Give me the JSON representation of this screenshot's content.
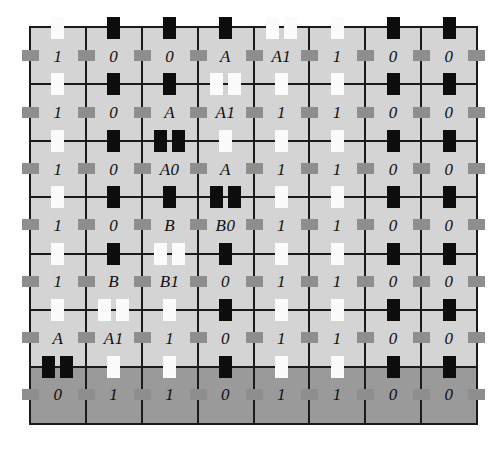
{
  "figure": {
    "kind": "encoded-grid-diagram",
    "columns": 8,
    "rows": 7,
    "colors": {
      "page_background": "#ffffff",
      "cell_light": "#d4d4d4",
      "cell_dark": "#9a9a9a",
      "rule": "#1a1a1a",
      "mark_black": "#0d0d0d",
      "mark_white": "#fbfbfb",
      "tick_gray": "#8e8e8e"
    }
  },
  "grid": {
    "rows": [
      {
        "index": 0,
        "shade": "light",
        "cells": [
          {
            "label": "1",
            "top_marks": [
              {
                "color": "white",
                "offset": 0
              }
            ],
            "bottom_marks": [
              {
                "color": "white",
                "offset": 0
              }
            ]
          },
          {
            "label": "0",
            "top_marks": [
              {
                "color": "black",
                "offset": 0
              }
            ],
            "bottom_marks": [
              {
                "color": "black",
                "offset": 0
              }
            ]
          },
          {
            "label": "0",
            "top_marks": [
              {
                "color": "black",
                "offset": 0
              }
            ],
            "bottom_marks": [
              {
                "color": "black",
                "offset": 0
              }
            ]
          },
          {
            "label": "A",
            "top_marks": [
              {
                "color": "black",
                "offset": 0
              }
            ],
            "bottom_marks": [
              {
                "color": "white",
                "offset": -9
              },
              {
                "color": "white",
                "offset": 9
              }
            ]
          },
          {
            "label": "A1",
            "top_marks": [
              {
                "color": "white",
                "offset": -9
              },
              {
                "color": "white",
                "offset": 9
              }
            ],
            "bottom_marks": [
              {
                "color": "white",
                "offset": 0
              }
            ]
          },
          {
            "label": "1",
            "top_marks": [
              {
                "color": "white",
                "offset": 0
              }
            ],
            "bottom_marks": [
              {
                "color": "white",
                "offset": 0
              }
            ]
          },
          {
            "label": "0",
            "top_marks": [
              {
                "color": "black",
                "offset": 0
              }
            ],
            "bottom_marks": [
              {
                "color": "black",
                "offset": 0
              }
            ]
          },
          {
            "label": "0",
            "top_marks": [
              {
                "color": "black",
                "offset": 0
              }
            ],
            "bottom_marks": [
              {
                "color": "black",
                "offset": 0
              }
            ]
          }
        ]
      },
      {
        "index": 1,
        "shade": "light",
        "cells": [
          {
            "label": "1",
            "bottom_marks": [
              {
                "color": "white",
                "offset": 0
              }
            ]
          },
          {
            "label": "0",
            "bottom_marks": [
              {
                "color": "black",
                "offset": 0
              }
            ]
          },
          {
            "label": "A",
            "bottom_marks": [
              {
                "color": "black",
                "offset": -9
              },
              {
                "color": "black",
                "offset": 9
              }
            ]
          },
          {
            "label": "A1",
            "bottom_marks": [
              {
                "color": "white",
                "offset": 0
              }
            ]
          },
          {
            "label": "1",
            "bottom_marks": [
              {
                "color": "white",
                "offset": 0
              }
            ]
          },
          {
            "label": "1",
            "bottom_marks": [
              {
                "color": "white",
                "offset": 0
              }
            ]
          },
          {
            "label": "0",
            "bottom_marks": [
              {
                "color": "black",
                "offset": 0
              }
            ]
          },
          {
            "label": "0",
            "bottom_marks": [
              {
                "color": "black",
                "offset": 0
              }
            ]
          }
        ]
      },
      {
        "index": 2,
        "shade": "light",
        "cells": [
          {
            "label": "1",
            "bottom_marks": [
              {
                "color": "white",
                "offset": 0
              }
            ]
          },
          {
            "label": "0",
            "bottom_marks": [
              {
                "color": "black",
                "offset": 0
              }
            ]
          },
          {
            "label": "A0",
            "bottom_marks": [
              {
                "color": "black",
                "offset": 0
              }
            ]
          },
          {
            "label": "A",
            "bottom_marks": [
              {
                "color": "black",
                "offset": -9
              },
              {
                "color": "black",
                "offset": 9
              }
            ]
          },
          {
            "label": "1",
            "bottom_marks": [
              {
                "color": "white",
                "offset": 0
              }
            ]
          },
          {
            "label": "1",
            "bottom_marks": [
              {
                "color": "white",
                "offset": 0
              }
            ]
          },
          {
            "label": "0",
            "bottom_marks": [
              {
                "color": "black",
                "offset": 0
              }
            ]
          },
          {
            "label": "0",
            "bottom_marks": [
              {
                "color": "black",
                "offset": 0
              }
            ]
          }
        ]
      },
      {
        "index": 3,
        "shade": "light",
        "cells": [
          {
            "label": "1",
            "bottom_marks": [
              {
                "color": "white",
                "offset": 0
              }
            ]
          },
          {
            "label": "0",
            "bottom_marks": [
              {
                "color": "black",
                "offset": 0
              }
            ]
          },
          {
            "label": "B",
            "bottom_marks": [
              {
                "color": "white",
                "offset": -9
              },
              {
                "color": "white",
                "offset": 9
              }
            ]
          },
          {
            "label": "B0",
            "bottom_marks": [
              {
                "color": "black",
                "offset": 0
              }
            ]
          },
          {
            "label": "1",
            "bottom_marks": [
              {
                "color": "white",
                "offset": 0
              }
            ]
          },
          {
            "label": "1",
            "bottom_marks": [
              {
                "color": "white",
                "offset": 0
              }
            ]
          },
          {
            "label": "0",
            "bottom_marks": [
              {
                "color": "black",
                "offset": 0
              }
            ]
          },
          {
            "label": "0",
            "bottom_marks": [
              {
                "color": "black",
                "offset": 0
              }
            ]
          }
        ]
      },
      {
        "index": 4,
        "shade": "light",
        "cells": [
          {
            "label": "1",
            "bottom_marks": [
              {
                "color": "white",
                "offset": 0
              }
            ]
          },
          {
            "label": "B",
            "bottom_marks": [
              {
                "color": "white",
                "offset": -9
              },
              {
                "color": "white",
                "offset": 9
              }
            ]
          },
          {
            "label": "B1",
            "bottom_marks": [
              {
                "color": "white",
                "offset": 0
              }
            ]
          },
          {
            "label": "0",
            "bottom_marks": [
              {
                "color": "black",
                "offset": 0
              }
            ]
          },
          {
            "label": "1",
            "bottom_marks": [
              {
                "color": "white",
                "offset": 0
              }
            ]
          },
          {
            "label": "1",
            "bottom_marks": [
              {
                "color": "white",
                "offset": 0
              }
            ]
          },
          {
            "label": "0",
            "bottom_marks": [
              {
                "color": "black",
                "offset": 0
              }
            ]
          },
          {
            "label": "0",
            "bottom_marks": [
              {
                "color": "black",
                "offset": 0
              }
            ]
          }
        ]
      },
      {
        "index": 5,
        "shade": "light",
        "cells": [
          {
            "label": "A",
            "bottom_marks": [
              {
                "color": "black",
                "offset": -9
              },
              {
                "color": "black",
                "offset": 9
              }
            ]
          },
          {
            "label": "A1",
            "bottom_marks": [
              {
                "color": "white",
                "offset": 0
              }
            ]
          },
          {
            "label": "1",
            "bottom_marks": [
              {
                "color": "white",
                "offset": 0
              }
            ]
          },
          {
            "label": "0",
            "bottom_marks": [
              {
                "color": "black",
                "offset": 0
              }
            ]
          },
          {
            "label": "1",
            "bottom_marks": [
              {
                "color": "white",
                "offset": 0
              }
            ]
          },
          {
            "label": "1",
            "bottom_marks": [
              {
                "color": "white",
                "offset": 0
              }
            ]
          },
          {
            "label": "0",
            "bottom_marks": [
              {
                "color": "black",
                "offset": 0
              }
            ]
          },
          {
            "label": "0",
            "bottom_marks": [
              {
                "color": "black",
                "offset": 0
              }
            ]
          }
        ]
      },
      {
        "index": 6,
        "shade": "dark",
        "cells": [
          {
            "label": "0"
          },
          {
            "label": "1"
          },
          {
            "label": "1"
          },
          {
            "label": "0"
          },
          {
            "label": "1"
          },
          {
            "label": "1"
          },
          {
            "label": "0"
          },
          {
            "label": "0"
          }
        ]
      }
    ]
  }
}
